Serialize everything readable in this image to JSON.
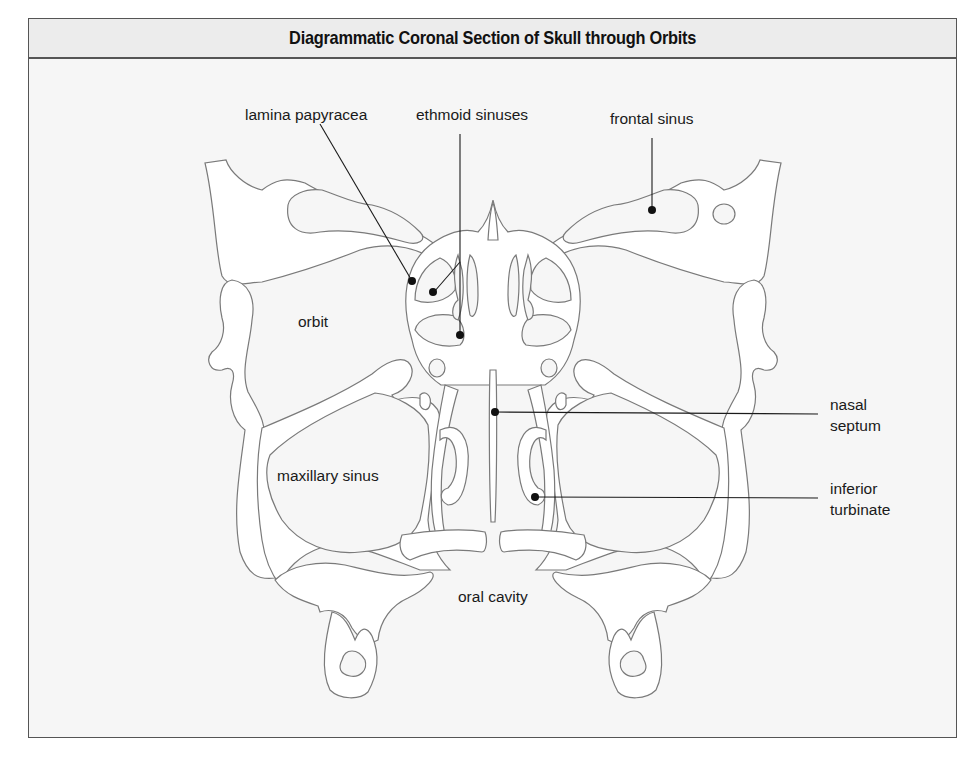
{
  "figure": {
    "title": "Diagrammatic Coronal Section of Skull through Orbits"
  },
  "labels": {
    "lamina_papyracea": "lamina papyracea",
    "ethmoid_sinuses": "ethmoid sinuses",
    "frontal_sinus": "frontal sinus",
    "orbit": "orbit",
    "nasal_septum_line1": "nasal",
    "nasal_septum_line2": "septum",
    "maxillary_sinus": "maxillary sinus",
    "inferior_turbinate_line1": "inferior",
    "inferior_turbinate_line2": "turbinate",
    "oral_cavity": "oral cavity"
  },
  "colors": {
    "title_band": "#ececec",
    "background": "#f6f6f6",
    "bone_fill": "#ffffff",
    "outline": "#7a7a7a",
    "leader": "#1a1a1a",
    "frame": "#555555"
  }
}
